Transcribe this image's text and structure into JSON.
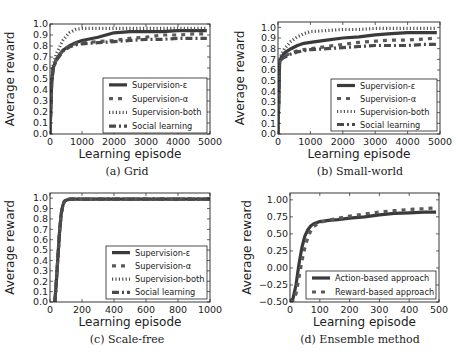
{
  "figure": {
    "panels": [
      "a",
      "b",
      "c",
      "d"
    ]
  },
  "chart_data": [
    {
      "id": "a",
      "type": "line",
      "caption": "(a) Grid",
      "xlabel": "Learning episode",
      "ylabel": "Average reward",
      "xlim": [
        0,
        5000
      ],
      "ylim": [
        0.0,
        1.0
      ],
      "xticks": [
        0,
        1000,
        2000,
        3000,
        4000,
        5000
      ],
      "xtick_labels": [
        "0",
        "1000",
        "2000",
        "3000",
        "4000",
        "5000"
      ],
      "yticks": [
        0.0,
        0.1,
        0.2,
        0.3,
        0.4,
        0.5,
        0.6,
        0.7,
        0.8,
        0.9,
        1.0
      ],
      "ytick_labels": [
        "0.0",
        "0.1",
        "0.2",
        "0.3",
        "0.4",
        "0.5",
        "0.6",
        "0.7",
        "0.8",
        "0.9",
        "1.0"
      ],
      "legend_position": "lower right",
      "grid": false,
      "x": [
        0,
        50,
        100,
        200,
        400,
        600,
        800,
        1000,
        1500,
        2000,
        2500,
        3000,
        3500,
        4000,
        4500,
        4900
      ],
      "series": [
        {
          "name": "Supervision-ε",
          "style": "solid",
          "values": [
            0.0,
            0.45,
            0.6,
            0.68,
            0.76,
            0.8,
            0.83,
            0.85,
            0.88,
            0.92,
            0.93,
            0.93,
            0.93,
            0.94,
            0.94,
            0.94
          ]
        },
        {
          "name": "Supervision-α",
          "style": "dashed",
          "values": [
            0.0,
            0.45,
            0.6,
            0.68,
            0.76,
            0.8,
            0.82,
            0.83,
            0.84,
            0.85,
            0.87,
            0.88,
            0.9,
            0.9,
            0.91,
            0.91
          ]
        },
        {
          "name": "Supervision-both",
          "style": "dotted",
          "values": [
            0.0,
            0.5,
            0.63,
            0.73,
            0.85,
            0.92,
            0.95,
            0.96,
            0.96,
            0.96,
            0.96,
            0.96,
            0.96,
            0.96,
            0.96,
            0.96
          ]
        },
        {
          "name": "Social learning",
          "style": "dashdot",
          "values": [
            0.0,
            0.45,
            0.6,
            0.67,
            0.75,
            0.79,
            0.81,
            0.82,
            0.83,
            0.84,
            0.85,
            0.86,
            0.86,
            0.87,
            0.87,
            0.87
          ]
        }
      ]
    },
    {
      "id": "b",
      "type": "line",
      "caption": "(b) Small-world",
      "xlabel": "Learning episode",
      "ylabel": "Average reward",
      "xlim": [
        0,
        5000
      ],
      "ylim": [
        0.0,
        1.05
      ],
      "xticks": [
        0,
        1000,
        2000,
        3000,
        4000,
        5000
      ],
      "xtick_labels": [
        "0",
        "1000",
        "2000",
        "3000",
        "4000",
        "5000"
      ],
      "yticks": [
        0.0,
        0.1,
        0.2,
        0.3,
        0.4,
        0.5,
        0.6,
        0.7,
        0.8,
        0.9,
        1.0
      ],
      "ytick_labels": [
        "0.0",
        "0.1",
        "0.2",
        "0.3",
        "0.4",
        "0.5",
        "0.6",
        "0.7",
        "0.8",
        "0.9",
        "1.0"
      ],
      "legend_position": "lower right",
      "grid": false,
      "x": [
        0,
        50,
        100,
        200,
        400,
        600,
        800,
        1000,
        1500,
        2000,
        2500,
        3000,
        3500,
        4000,
        4500,
        4900
      ],
      "series": [
        {
          "name": "Supervision-ε",
          "style": "solid",
          "values": [
            0.0,
            0.68,
            0.72,
            0.76,
            0.8,
            0.83,
            0.85,
            0.86,
            0.88,
            0.9,
            0.91,
            0.93,
            0.94,
            0.95,
            0.95,
            0.95
          ]
        },
        {
          "name": "Supervision-α",
          "style": "dashed",
          "values": [
            0.0,
            0.68,
            0.7,
            0.73,
            0.76,
            0.78,
            0.79,
            0.8,
            0.82,
            0.84,
            0.86,
            0.87,
            0.88,
            0.88,
            0.89,
            0.9
          ]
        },
        {
          "name": "Supervision-both",
          "style": "dotted",
          "values": [
            0.0,
            0.69,
            0.74,
            0.8,
            0.87,
            0.91,
            0.94,
            0.96,
            0.97,
            0.98,
            0.98,
            0.99,
            0.99,
            0.99,
            0.99,
            0.99
          ]
        },
        {
          "name": "Social learning",
          "style": "dashdot",
          "values": [
            0.0,
            0.68,
            0.7,
            0.72,
            0.75,
            0.77,
            0.78,
            0.79,
            0.8,
            0.81,
            0.82,
            0.83,
            0.83,
            0.83,
            0.84,
            0.84
          ]
        }
      ]
    },
    {
      "id": "c",
      "type": "line",
      "caption": "(c) Scale-free",
      "xlabel": "Learning episode",
      "ylabel": "Average reward",
      "xlim": [
        0,
        1000
      ],
      "ylim": [
        0.0,
        1.05
      ],
      "xticks": [
        0,
        200,
        400,
        600,
        800,
        1000
      ],
      "xtick_labels": [
        "0",
        "200",
        "400",
        "600",
        "800",
        "1000"
      ],
      "yticks": [
        0.0,
        0.1,
        0.2,
        0.3,
        0.4,
        0.5,
        0.6,
        0.7,
        0.8,
        0.9,
        1.0
      ],
      "ytick_labels": [
        "0.0",
        "0.1",
        "0.2",
        "0.3",
        "0.4",
        "0.5",
        "0.6",
        "0.7",
        "0.8",
        "0.9",
        "1.0"
      ],
      "legend_position": "lower right",
      "grid": false,
      "x": [
        30,
        40,
        50,
        60,
        70,
        80,
        90,
        100,
        120,
        150,
        200,
        400,
        600,
        800,
        1000
      ],
      "series": [
        {
          "name": "Supervision-ε",
          "style": "solid",
          "values": [
            0.0,
            0.2,
            0.45,
            0.68,
            0.85,
            0.93,
            0.97,
            0.98,
            0.99,
            0.99,
            0.99,
            0.99,
            0.99,
            0.99,
            0.99
          ]
        },
        {
          "name": "Supervision-α",
          "style": "dashed",
          "values": [
            0.0,
            0.2,
            0.45,
            0.68,
            0.85,
            0.93,
            0.97,
            0.98,
            0.99,
            0.99,
            0.99,
            0.99,
            0.99,
            0.99,
            0.99
          ]
        },
        {
          "name": "Supervision-both",
          "style": "dotted",
          "values": [
            0.0,
            0.2,
            0.45,
            0.68,
            0.85,
            0.93,
            0.97,
            0.98,
            0.99,
            0.99,
            0.99,
            0.99,
            0.99,
            0.99,
            0.99
          ]
        },
        {
          "name": "Social learning",
          "style": "dashdot",
          "values": [
            0.0,
            0.2,
            0.45,
            0.68,
            0.85,
            0.93,
            0.97,
            0.98,
            0.99,
            0.99,
            0.99,
            0.99,
            0.99,
            0.99,
            0.99
          ]
        }
      ]
    },
    {
      "id": "d",
      "type": "line",
      "caption": "(d) Ensemble method",
      "xlabel": "Learning episode",
      "ylabel": "Average reward",
      "xlim": [
        0,
        500
      ],
      "ylim": [
        -0.5,
        1.1
      ],
      "xticks": [
        0,
        100,
        200,
        300,
        400,
        500
      ],
      "xtick_labels": [
        "0",
        "100",
        "200",
        "300",
        "400",
        "500"
      ],
      "yticks": [
        -0.5,
        -0.25,
        0.0,
        0.25,
        0.5,
        0.75,
        1.0
      ],
      "ytick_labels": [
        "−0.50",
        "−0.25",
        "0.00",
        "0.25",
        "0.50",
        "0.75",
        "1.00"
      ],
      "legend_position": "lower right",
      "grid": false,
      "x": [
        0,
        10,
        20,
        30,
        40,
        50,
        60,
        70,
        80,
        100,
        130,
        160,
        200,
        250,
        300,
        350,
        400,
        450,
        490
      ],
      "series": [
        {
          "name": "Action-based approach",
          "style": "solid",
          "values": [
            -0.5,
            -0.45,
            -0.25,
            0.05,
            0.3,
            0.47,
            0.56,
            0.62,
            0.65,
            0.68,
            0.7,
            0.71,
            0.73,
            0.75,
            0.78,
            0.8,
            0.81,
            0.82,
            0.82
          ]
        },
        {
          "name": "Reward-based approach",
          "style": "dashed",
          "values": [
            -0.5,
            -0.48,
            -0.38,
            -0.15,
            0.1,
            0.3,
            0.45,
            0.55,
            0.61,
            0.67,
            0.7,
            0.73,
            0.76,
            0.79,
            0.82,
            0.84,
            0.86,
            0.87,
            0.88
          ]
        }
      ]
    }
  ]
}
